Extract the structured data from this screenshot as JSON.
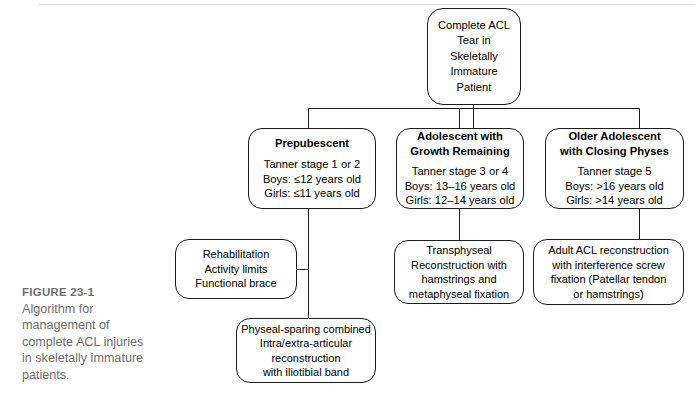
{
  "figure": {
    "label": "FIGURE 23-1",
    "caption": "Algorithm for management of complete ACL injuries in skeletally immature patients."
  },
  "colors": {
    "box_border": "#1b1b1b",
    "connector": "#1b1b1b",
    "caption_text": "#6f6f6f",
    "background": "#ffffff"
  },
  "chart_data": {
    "type": "diagram",
    "title": "Algorithm for management of complete ACL injuries in skeletally immature patients.",
    "orientation": "top-down",
    "nodes": [
      {
        "id": "root",
        "role": "root",
        "lines": [
          "Complete ACL",
          "Tear in",
          "Skeletally",
          "Immature",
          "Patient"
        ]
      },
      {
        "id": "prepubescent",
        "role": "branch",
        "heading": "Prepubescent",
        "lines": [
          "Tanner stage 1 or 2",
          "Boys: ≤12 years old",
          "Girls: ≤11 years old"
        ]
      },
      {
        "id": "adolescent-growth",
        "role": "branch",
        "heading_lines": [
          "Adolescent with",
          "Growth Remaining"
        ],
        "lines": [
          "Tanner stage 3 or 4",
          "Boys: 13–16 years old",
          "Girls: 12–14 years old"
        ]
      },
      {
        "id": "older-adolescent",
        "role": "branch",
        "heading_lines": [
          "Older Adolescent",
          "with Closing Physes"
        ],
        "lines": [
          "Tanner stage 5",
          "Boys: >16 years old",
          "Girls: >14 years old"
        ]
      },
      {
        "id": "rehabilitation",
        "role": "treatment",
        "lines": [
          "Rehabilitation",
          "Activity limits",
          "Functional brace"
        ]
      },
      {
        "id": "transphyseal",
        "role": "treatment",
        "lines": [
          "Transphyseal",
          "Reconstruction with",
          "hamstrings and",
          "metaphyseal fixation"
        ]
      },
      {
        "id": "adult-acl",
        "role": "treatment",
        "lines": [
          "Adult ACL reconstruction",
          "with interference screw",
          "fixation (Patellar tendon",
          "or hamstrings)"
        ]
      },
      {
        "id": "physeal-sparing",
        "role": "treatment",
        "lines": [
          "Physeal-sparing combined",
          "Intra/extra-articular",
          "reconstruction",
          "with iliotibial band"
        ]
      }
    ],
    "edges": [
      {
        "from": "root",
        "to": "prepubescent"
      },
      {
        "from": "root",
        "to": "adolescent-growth"
      },
      {
        "from": "root",
        "to": "older-adolescent"
      },
      {
        "from": "prepubescent",
        "to": "rehabilitation"
      },
      {
        "from": "prepubescent",
        "to": "physeal-sparing"
      },
      {
        "from": "adolescent-growth",
        "to": "transphyseal"
      },
      {
        "from": "older-adolescent",
        "to": "adult-acl"
      }
    ]
  }
}
